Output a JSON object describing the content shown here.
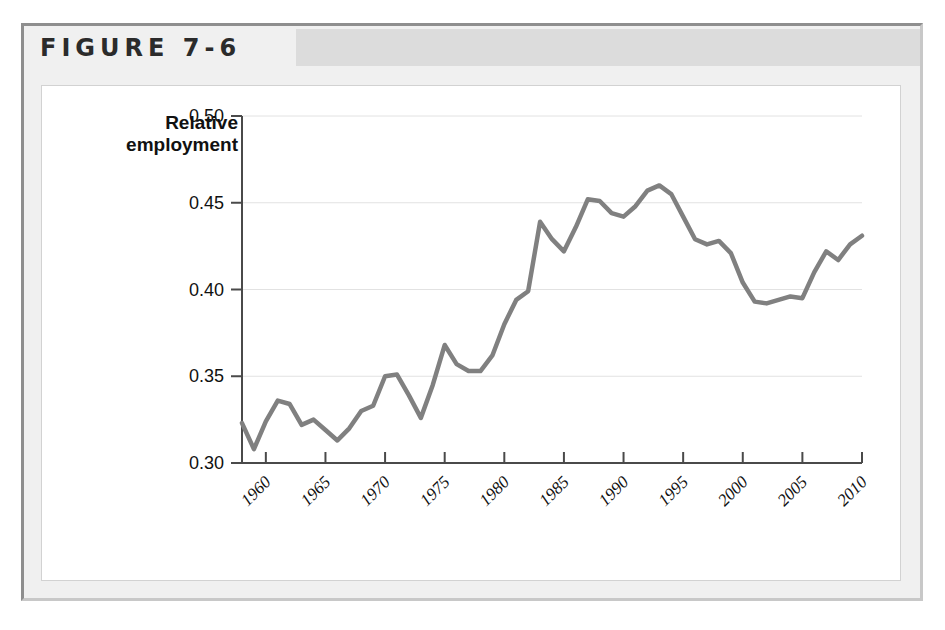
{
  "figure": {
    "label": "FIGURE 7-6"
  },
  "chart_data": {
    "type": "line",
    "title": "",
    "xlabel": "",
    "ylabel": "Relative employment",
    "ylabel_lines": [
      "Relative",
      "employment"
    ],
    "xlim": [
      1958,
      2010
    ],
    "ylim": [
      0.3,
      0.5
    ],
    "grid": true,
    "legend": "none",
    "line_color": "#808080",
    "y_ticks": [
      "0.50",
      "0.45",
      "0.40",
      "0.35",
      "0.30"
    ],
    "y_tick_values": [
      0.5,
      0.45,
      0.4,
      0.35,
      0.3
    ],
    "x_ticks": [
      "1960",
      "1965",
      "1970",
      "1975",
      "1980",
      "1985",
      "1990",
      "1995",
      "2000",
      "2005",
      "2010"
    ],
    "x_tick_values": [
      1960,
      1965,
      1970,
      1975,
      1980,
      1985,
      1990,
      1995,
      2000,
      2005,
      2010
    ],
    "x": [
      1958,
      1959,
      1960,
      1961,
      1962,
      1963,
      1964,
      1965,
      1966,
      1967,
      1968,
      1969,
      1970,
      1971,
      1972,
      1973,
      1974,
      1975,
      1976,
      1977,
      1978,
      1979,
      1980,
      1981,
      1982,
      1983,
      1984,
      1985,
      1986,
      1987,
      1988,
      1989,
      1990,
      1991,
      1992,
      1993,
      1994,
      1995,
      1996,
      1997,
      1998,
      1999,
      2000,
      2001,
      2002,
      2003,
      2004,
      2005,
      2006,
      2007,
      2008,
      2009,
      2010
    ],
    "values": [
      0.323,
      0.308,
      0.324,
      0.336,
      0.334,
      0.322,
      0.325,
      0.319,
      0.313,
      0.32,
      0.33,
      0.333,
      0.35,
      0.351,
      0.339,
      0.326,
      0.345,
      0.368,
      0.357,
      0.353,
      0.353,
      0.362,
      0.38,
      0.394,
      0.399,
      0.439,
      0.429,
      0.422,
      0.436,
      0.452,
      0.451,
      0.444,
      0.442,
      0.448,
      0.457,
      0.46,
      0.455,
      0.442,
      0.429,
      0.426,
      0.428,
      0.421,
      0.404,
      0.393,
      0.392,
      0.394,
      0.396,
      0.395,
      0.41,
      0.422,
      0.417,
      0.426,
      0.431
    ]
  }
}
